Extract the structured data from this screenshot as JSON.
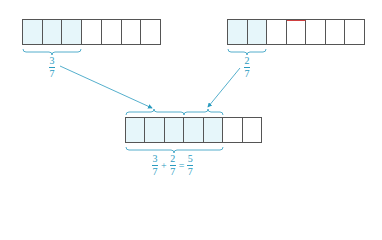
{
  "colors": {
    "accent": "#2a9bbf",
    "shaded_cell": "#e6f6fa",
    "border": "#555555"
  },
  "diagram": {
    "top_left_bar": {
      "cells": 7,
      "shaded": 3,
      "label": {
        "numerator": "3",
        "denominator": "7"
      }
    },
    "top_right_bar": {
      "cells": 7,
      "shaded": 2,
      "label": {
        "numerator": "2",
        "denominator": "7"
      }
    },
    "bottom_bar": {
      "cells": 7,
      "shaded": 5,
      "equation": {
        "term1": {
          "numerator": "3",
          "denominator": "7"
        },
        "op1": "+",
        "term2": {
          "numerator": "2",
          "denominator": "7"
        },
        "op2": "=",
        "result": {
          "numerator": "5",
          "denominator": "7"
        }
      }
    }
  }
}
